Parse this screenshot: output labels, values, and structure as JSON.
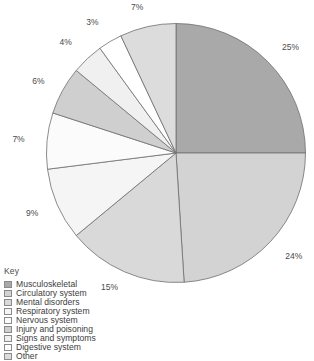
{
  "chart_data": {
    "type": "pie",
    "title": "",
    "legend_title": "Key",
    "legend_position": "bottom-left",
    "start_angle_deg": 0,
    "direction": "clockwise",
    "categories": [
      "Musculoskeletal",
      "Circulatory system",
      "Mental disorders",
      "Respiratory system",
      "Nervous system",
      "Injury and poisoning",
      "Signs and symptoms",
      "Digestive system",
      "Other"
    ],
    "values": [
      25,
      24,
      15,
      9,
      7,
      6,
      4,
      3,
      7
    ],
    "labels": [
      "25%",
      "24%",
      "15%",
      "9%",
      "7%",
      "6%",
      "4%",
      "3%",
      "7%"
    ],
    "colors": [
      "#a9a9a9",
      "#d3d3d3",
      "#d9d9d9",
      "#f5f5f5",
      "#fbfbfb",
      "#cfcfcf",
      "#f0f0f0",
      "#ffffff",
      "#dcdcdc"
    ],
    "slice_stroke": "#6e6e6e",
    "label_color": "#4a4a4a",
    "units": "percent"
  },
  "legend": {
    "title": "Key",
    "items": [
      {
        "label": "Musculoskeletal",
        "color": "#a9a9a9"
      },
      {
        "label": "Circulatory system",
        "color": "#d3d3d3"
      },
      {
        "label": "Mental disorders",
        "color": "#d9d9d9"
      },
      {
        "label": "Respiratory system",
        "color": "#f5f5f5"
      },
      {
        "label": "Nervous system",
        "color": "#fbfbfb"
      },
      {
        "label": "Injury and poisoning",
        "color": "#cfcfcf"
      },
      {
        "label": "Signs and symptoms",
        "color": "#f0f0f0"
      },
      {
        "label": "Digestive system",
        "color": "#ffffff"
      },
      {
        "label": "Other",
        "color": "#dcdcdc"
      }
    ]
  }
}
